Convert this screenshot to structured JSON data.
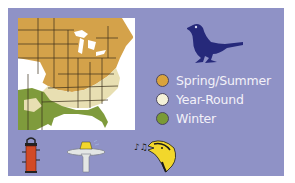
{
  "card": {
    "background": "#8f92c6"
  },
  "map": {
    "name": "range-map-eastern-us",
    "colors": {
      "spring_summer": "#d4a24a",
      "year_round": "#e8dfb2",
      "winter": "#7f9b3c",
      "ocean": "#ffffff",
      "border": "#3a2e1a"
    }
  },
  "bird_icon": {
    "name": "bird-silhouette-icon",
    "color": "#26297a"
  },
  "legend": {
    "items": [
      {
        "label": "Spring/Summer",
        "color": "#d9a33c"
      },
      {
        "label": "Year-Round",
        "color": "#f4f1d8"
      },
      {
        "label": "Winter",
        "color": "#7a9a35"
      }
    ]
  },
  "bottom_icons": [
    {
      "name": "tube-feeder-icon",
      "color": "#d24a26"
    },
    {
      "name": "birdbath-icon",
      "color": "#e3e6e4"
    },
    {
      "name": "song-icon",
      "color": "#f2d72b"
    }
  ]
}
